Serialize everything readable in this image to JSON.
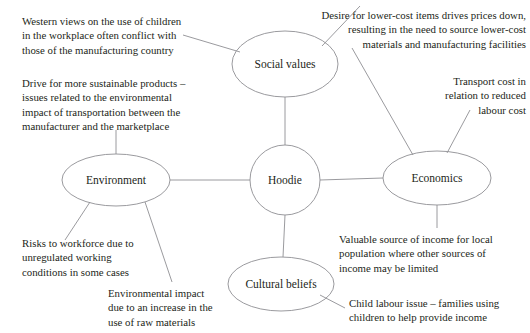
{
  "diagram": {
    "center": {
      "label": "Hoodie"
    },
    "branches": [
      {
        "id": "social-values",
        "label": "Social\nvalues"
      },
      {
        "id": "environment",
        "label": "Environment"
      },
      {
        "id": "economics",
        "label": "Economics"
      },
      {
        "id": "cultural-beliefs",
        "label": "Cultural\nbeliefs"
      }
    ],
    "callouts": [
      {
        "id": "western-views",
        "text": "Western views on the use of children\nin the workplace often conflict with\nthose of the manufacturing country",
        "align": "left"
      },
      {
        "id": "sustainable-products",
        "text": "Drive for more sustainable products –\nissues related to the environmental\nimpact of transportation between the\nmanufacturer and the marketplace",
        "align": "left"
      },
      {
        "id": "lower-cost-items",
        "text": "Desire for lower-cost items drives prices down,\nresulting in the need to source lower-cost\nmaterials and manufacturing facilities",
        "align": "right"
      },
      {
        "id": "transport-cost",
        "text": "Transport cost in\nrelation to reduced\nlabour cost",
        "align": "right"
      },
      {
        "id": "workforce-risks",
        "text": "Risks to workforce due to\nunregulated working\nconditions in some cases",
        "align": "left"
      },
      {
        "id": "raw-materials",
        "text": "Environmental impact\ndue to an increase in the\nuse of raw materials",
        "align": "left"
      },
      {
        "id": "valuable-income",
        "text": "Valuable source of income for local\npopulation where other sources of\nincome may be limited",
        "align": "left"
      },
      {
        "id": "child-labour",
        "text": "Child labour issue – families using\nchildren to help provide income",
        "align": "left"
      }
    ],
    "colors": {
      "background": "#ffffff",
      "stroke": "#8e8e93",
      "text": "#231f20"
    }
  }
}
